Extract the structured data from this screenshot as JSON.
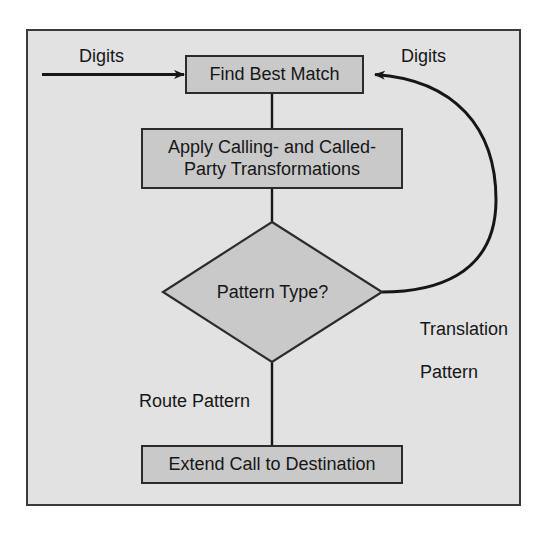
{
  "diagram": {
    "type": "flowchart",
    "panel": {
      "background_color": "#e2e2e2",
      "border_color": "#3a3a3a"
    },
    "style": {
      "node_fill": "#c9c9c9",
      "node_border": "#2b2b2b",
      "text_color": "#161616",
      "connector_color": "#161616"
    },
    "nodes": [
      {
        "id": "find-best-match",
        "shape": "rectangle",
        "label": "Find Best Match"
      },
      {
        "id": "apply-transformations",
        "shape": "rectangle",
        "label_line1": "Apply Calling- and Called-",
        "label_line2": "Party Transformations"
      },
      {
        "id": "pattern-type",
        "shape": "diamond",
        "label": "Pattern Type?"
      },
      {
        "id": "extend-call",
        "shape": "rectangle",
        "label": "Extend Call to Destination"
      }
    ],
    "edges": [
      {
        "id": "input-digits",
        "from": "external-input",
        "to": "find-best-match",
        "label": "Digits",
        "style": "straight-arrow"
      },
      {
        "id": "match-to-transform",
        "from": "find-best-match",
        "to": "apply-transformations",
        "label": "",
        "style": "straight-line"
      },
      {
        "id": "transform-to-decision",
        "from": "apply-transformations",
        "to": "pattern-type",
        "label": "",
        "style": "straight-line"
      },
      {
        "id": "translation-loopback",
        "from": "pattern-type",
        "to": "find-best-match",
        "label": "Translation\nPattern",
        "label_line1": "Translation",
        "label_line2": "Pattern",
        "return_label": "Digits",
        "style": "curved-arrow"
      },
      {
        "id": "route-to-extend",
        "from": "pattern-type",
        "to": "extend-call",
        "label": "Route Pattern",
        "style": "straight-line"
      }
    ]
  }
}
